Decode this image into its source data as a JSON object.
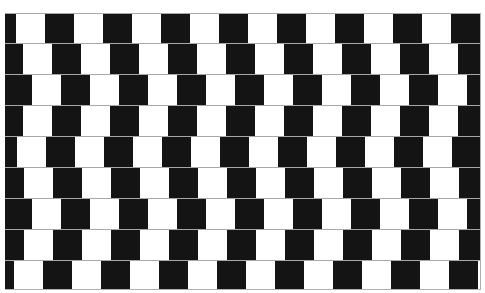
{
  "illusion": {
    "name": "Café wall illusion",
    "colors": {
      "dark_tile": "#141414",
      "light_tile": "#ffffff",
      "mortar": "#a8a8a8",
      "background": "#ffffff"
    },
    "wall": {
      "x": 5,
      "y": 13,
      "width": 475,
      "height": 276
    },
    "tile_width": 29,
    "period": 58,
    "rows": [
      {
        "index": 1,
        "top": 0,
        "height": 31,
        "first_dark_width": 11
      },
      {
        "index": 2,
        "top": 30,
        "height": 31,
        "first_dark_width": 18
      },
      {
        "index": 3,
        "top": 61,
        "height": 31,
        "first_dark_width": 27
      },
      {
        "index": 4,
        "top": 92,
        "height": 31,
        "first_dark_width": 18
      },
      {
        "index": 5,
        "top": 123,
        "height": 31,
        "first_dark_width": 12
      },
      {
        "index": 6,
        "top": 154,
        "height": 31,
        "first_dark_width": 19
      },
      {
        "index": 7,
        "top": 185,
        "height": 31,
        "first_dark_width": 27
      },
      {
        "index": 8,
        "top": 216,
        "height": 31,
        "first_dark_width": 19
      },
      {
        "index": 9,
        "top": 247,
        "height": 29,
        "first_dark_width": 9
      }
    ]
  }
}
